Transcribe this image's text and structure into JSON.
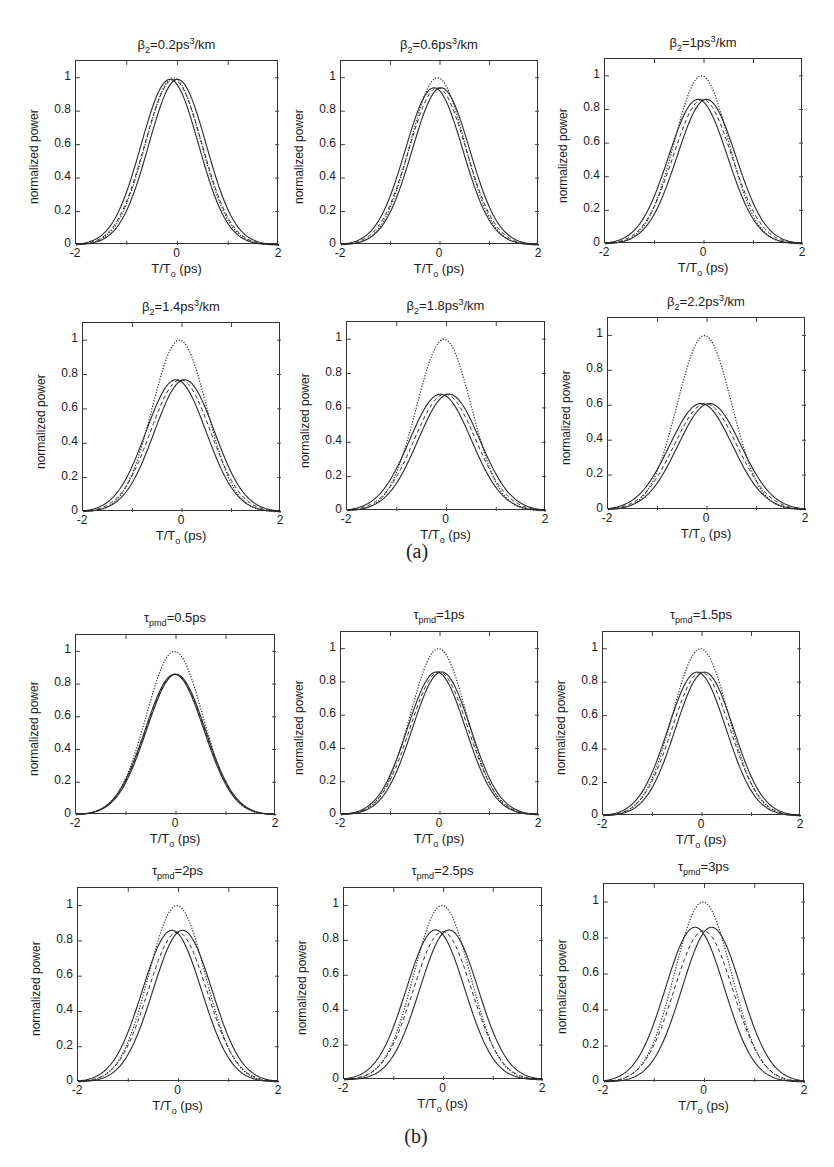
{
  "captions": {
    "a": "(a)",
    "b": "(b)"
  },
  "axis_common": {
    "xlabel_main": "T/T",
    "xlabel_sub": "o",
    "xlabel_unit": " (ps)",
    "ylabel": "normalized power",
    "xticks": [
      "-2",
      "0",
      "2"
    ],
    "yticks": [
      "0",
      "0.2",
      "0.4",
      "0.6",
      "0.8",
      "1"
    ]
  },
  "chart_data": [
    {
      "type": "line",
      "group": "a",
      "title": "β2=0.2ps3/km",
      "title_parts": {
        "sym": "β",
        "sub": "2",
        "val": "=0.2ps",
        "sup": "3",
        "unit": "/km"
      },
      "xlabel": "T/To (ps)",
      "ylabel": "normalized power",
      "xlim": [
        -2,
        2
      ],
      "ylim": [
        0,
        1.1
      ],
      "series": [
        {
          "name": "input (dotted)",
          "style": "dotted",
          "peak": 1.0,
          "center": -0.08,
          "width": 0.78
        },
        {
          "name": "output solid left",
          "style": "solid",
          "peak": 0.99,
          "center": -0.15,
          "width": 0.8
        },
        {
          "name": "output solid right",
          "style": "solid",
          "peak": 0.99,
          "center": 0.0,
          "width": 0.8
        },
        {
          "name": "output dashed",
          "style": "dashed",
          "peak": 0.99,
          "center": -0.08,
          "width": 0.8
        }
      ]
    },
    {
      "type": "line",
      "group": "a",
      "title": "β2=0.6ps3/km",
      "title_parts": {
        "sym": "β",
        "sub": "2",
        "val": "=0.6ps",
        "sup": "3",
        "unit": "/km"
      },
      "xlabel": "T/To (ps)",
      "ylabel": "normalized power",
      "xlim": [
        -2,
        2
      ],
      "ylim": [
        0,
        1.1
      ],
      "series": [
        {
          "name": "input (dotted)",
          "style": "dotted",
          "peak": 1.0,
          "center": -0.05,
          "width": 0.78
        },
        {
          "name": "output solid left",
          "style": "solid",
          "peak": 0.94,
          "center": -0.12,
          "width": 0.82
        },
        {
          "name": "output solid right",
          "style": "solid",
          "peak": 0.94,
          "center": 0.02,
          "width": 0.82
        },
        {
          "name": "output dashed",
          "style": "dashed",
          "peak": 0.94,
          "center": -0.05,
          "width": 0.82
        }
      ]
    },
    {
      "type": "line",
      "group": "a",
      "title": "β2=1ps3/km",
      "title_parts": {
        "sym": "β",
        "sub": "2",
        "val": "=1ps",
        "sup": "3",
        "unit": "/km"
      },
      "xlabel": "T/To (ps)",
      "ylabel": "normalized power",
      "xlim": [
        -2,
        2
      ],
      "ylim": [
        0,
        1.1
      ],
      "series": [
        {
          "name": "input (dotted)",
          "style": "dotted",
          "peak": 1.0,
          "center": -0.05,
          "width": 0.78
        },
        {
          "name": "output solid left",
          "style": "solid",
          "peak": 0.86,
          "center": -0.12,
          "width": 0.84
        },
        {
          "name": "output solid right",
          "style": "solid",
          "peak": 0.86,
          "center": 0.05,
          "width": 0.84
        },
        {
          "name": "output dashed",
          "style": "dashed",
          "peak": 0.86,
          "center": -0.03,
          "width": 0.84
        }
      ]
    },
    {
      "type": "line",
      "group": "a",
      "title": "β2=1.4ps3/km",
      "title_parts": {
        "sym": "β",
        "sub": "2",
        "val": "=1.4ps",
        "sup": "3",
        "unit": "/km"
      },
      "xlabel": "T/To (ps)",
      "ylabel": "normalized power",
      "xlim": [
        -2,
        2
      ],
      "ylim": [
        0,
        1.1
      ],
      "series": [
        {
          "name": "input (dotted)",
          "style": "dotted",
          "peak": 1.0,
          "center": -0.05,
          "width": 0.78
        },
        {
          "name": "output solid left",
          "style": "solid",
          "peak": 0.77,
          "center": -0.12,
          "width": 0.86
        },
        {
          "name": "output solid right",
          "style": "solid",
          "peak": 0.77,
          "center": 0.05,
          "width": 0.86
        },
        {
          "name": "output dashed",
          "style": "dashed",
          "peak": 0.77,
          "center": -0.03,
          "width": 0.86
        }
      ]
    },
    {
      "type": "line",
      "group": "a",
      "title": "β2=1.8ps3/km",
      "title_parts": {
        "sym": "β",
        "sub": "2",
        "val": "=1.8ps",
        "sup": "3",
        "unit": "/km"
      },
      "xlabel": "T/To (ps)",
      "ylabel": "normalized power",
      "xlim": [
        -2,
        2
      ],
      "ylim": [
        0,
        1.1
      ],
      "series": [
        {
          "name": "input (dotted)",
          "style": "dotted",
          "peak": 1.0,
          "center": -0.05,
          "width": 0.78
        },
        {
          "name": "output solid left",
          "style": "solid",
          "peak": 0.68,
          "center": -0.12,
          "width": 0.88
        },
        {
          "name": "output solid right",
          "style": "solid",
          "peak": 0.68,
          "center": 0.05,
          "width": 0.88
        },
        {
          "name": "output dashed",
          "style": "dashed",
          "peak": 0.68,
          "center": -0.03,
          "width": 0.88
        }
      ]
    },
    {
      "type": "line",
      "group": "a",
      "title": "β2=2.2ps3/km",
      "title_parts": {
        "sym": "β",
        "sub": "2",
        "val": "=2.2ps",
        "sup": "3",
        "unit": "/km"
      },
      "xlabel": "T/To (ps)",
      "ylabel": "normalized power",
      "xlim": [
        -2,
        2
      ],
      "ylim": [
        0,
        1.1
      ],
      "series": [
        {
          "name": "input (dotted)",
          "style": "dotted",
          "peak": 1.0,
          "center": -0.05,
          "width": 0.78
        },
        {
          "name": "output solid left",
          "style": "solid",
          "peak": 0.61,
          "center": -0.12,
          "width": 0.9
        },
        {
          "name": "output solid right",
          "style": "solid",
          "peak": 0.61,
          "center": 0.05,
          "width": 0.9
        },
        {
          "name": "output dashed",
          "style": "dashed",
          "peak": 0.61,
          "center": -0.03,
          "width": 0.9
        }
      ]
    },
    {
      "type": "line",
      "group": "b",
      "title": "τpmd=0.5ps",
      "title_parts": {
        "sym": "τ",
        "sub": "pmd",
        "val": "=0.5ps",
        "sup": "",
        "unit": ""
      },
      "xlabel": "T/To (ps)",
      "ylabel": "normalized power",
      "xlim": [
        -2,
        2
      ],
      "ylim": [
        0,
        1.1
      ],
      "series": [
        {
          "name": "input (dotted)",
          "style": "dotted",
          "peak": 1.0,
          "center": -0.03,
          "width": 0.8
        },
        {
          "name": "output solid left",
          "style": "solid",
          "peak": 0.86,
          "center": -0.03,
          "width": 0.83
        },
        {
          "name": "output solid right",
          "style": "solid",
          "peak": 0.86,
          "center": 0.0,
          "width": 0.83
        },
        {
          "name": "output dashed",
          "style": "dashed",
          "peak": 0.86,
          "center": -0.015,
          "width": 0.83
        }
      ]
    },
    {
      "type": "line",
      "group": "b",
      "title": "τpmd=1ps",
      "title_parts": {
        "sym": "τ",
        "sub": "pmd",
        "val": "=1ps",
        "sup": "",
        "unit": ""
      },
      "xlabel": "T/To (ps)",
      "ylabel": "normalized power",
      "xlim": [
        -2,
        2
      ],
      "ylim": [
        0,
        1.1
      ],
      "series": [
        {
          "name": "input (dotted)",
          "style": "dotted",
          "peak": 1.0,
          "center": -0.03,
          "width": 0.8
        },
        {
          "name": "output solid left",
          "style": "solid",
          "peak": 0.86,
          "center": -0.07,
          "width": 0.83
        },
        {
          "name": "output solid right",
          "style": "solid",
          "peak": 0.86,
          "center": 0.03,
          "width": 0.83
        },
        {
          "name": "output dashed",
          "style": "dashed",
          "peak": 0.86,
          "center": -0.02,
          "width": 0.83
        }
      ]
    },
    {
      "type": "line",
      "group": "b",
      "title": "τpmd=1.5ps",
      "title_parts": {
        "sym": "τ",
        "sub": "pmd",
        "val": "=1.5ps",
        "sup": "",
        "unit": ""
      },
      "xlabel": "T/To (ps)",
      "ylabel": "normalized power",
      "xlim": [
        -2,
        2
      ],
      "ylim": [
        0,
        1.1
      ],
      "series": [
        {
          "name": "input (dotted)",
          "style": "dotted",
          "peak": 1.0,
          "center": -0.03,
          "width": 0.8
        },
        {
          "name": "output solid left",
          "style": "solid",
          "peak": 0.86,
          "center": -0.1,
          "width": 0.83
        },
        {
          "name": "output solid right",
          "style": "solid",
          "peak": 0.86,
          "center": 0.05,
          "width": 0.83
        },
        {
          "name": "output dashed",
          "style": "dashed",
          "peak": 0.86,
          "center": -0.02,
          "width": 0.83
        }
      ]
    },
    {
      "type": "line",
      "group": "b",
      "title": "τpmd=2ps",
      "title_parts": {
        "sym": "τ",
        "sub": "pmd",
        "val": "=2ps",
        "sup": "",
        "unit": ""
      },
      "xlabel": "T/To (ps)",
      "ylabel": "normalized power",
      "xlim": [
        -2,
        2
      ],
      "ylim": [
        0,
        1.1
      ],
      "series": [
        {
          "name": "input (dotted)",
          "style": "dotted",
          "peak": 1.0,
          "center": -0.03,
          "width": 0.8
        },
        {
          "name": "output solid left",
          "style": "solid",
          "peak": 0.86,
          "center": -0.13,
          "width": 0.83
        },
        {
          "name": "output solid right",
          "style": "solid",
          "peak": 0.86,
          "center": 0.08,
          "width": 0.83
        },
        {
          "name": "output dashed",
          "style": "dashed",
          "peak": 0.85,
          "center": -0.02,
          "width": 0.83
        }
      ]
    },
    {
      "type": "line",
      "group": "b",
      "title": "τpmd=2.5ps",
      "title_parts": {
        "sym": "τ",
        "sub": "pmd",
        "val": "=2.5ps",
        "sup": "",
        "unit": ""
      },
      "xlabel": "T/To (ps)",
      "ylabel": "normalized power",
      "xlim": [
        -2,
        2
      ],
      "ylim": [
        0,
        1.1
      ],
      "series": [
        {
          "name": "input (dotted)",
          "style": "dotted",
          "peak": 1.0,
          "center": -0.03,
          "width": 0.8
        },
        {
          "name": "output solid left",
          "style": "solid",
          "peak": 0.86,
          "center": -0.16,
          "width": 0.83
        },
        {
          "name": "output solid right",
          "style": "solid",
          "peak": 0.86,
          "center": 0.11,
          "width": 0.83
        },
        {
          "name": "output dashed",
          "style": "dashed",
          "peak": 0.85,
          "center": -0.02,
          "width": 0.83
        }
      ]
    },
    {
      "type": "line",
      "group": "b",
      "title": "τpmd=3ps",
      "title_parts": {
        "sym": "τ",
        "sub": "pmd",
        "val": "=3ps",
        "sup": "",
        "unit": ""
      },
      "xlabel": "T/To (ps)",
      "ylabel": "normalized power",
      "xlim": [
        -2,
        2
      ],
      "ylim": [
        0,
        1.1
      ],
      "series": [
        {
          "name": "input (dotted)",
          "style": "dotted",
          "peak": 1.0,
          "center": -0.03,
          "width": 0.8
        },
        {
          "name": "output solid left",
          "style": "solid",
          "peak": 0.86,
          "center": -0.19,
          "width": 0.83
        },
        {
          "name": "output solid right",
          "style": "solid",
          "peak": 0.86,
          "center": 0.14,
          "width": 0.83
        },
        {
          "name": "output dashed",
          "style": "dashed",
          "peak": 0.84,
          "center": -0.02,
          "width": 0.83
        }
      ]
    }
  ]
}
